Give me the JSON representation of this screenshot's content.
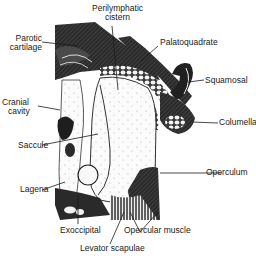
{
  "figure": {
    "labels": {
      "perilymphatic_cistern": [
        "Perilymphatic",
        "cistern"
      ],
      "parotic_cartilage": [
        "Parotic",
        "cartilage"
      ],
      "palatoquadrate": "Palatoquadrate",
      "squamosal": "Squamosal",
      "cranial_cavity": [
        "Cranial",
        "cavity"
      ],
      "columella": "Columella",
      "saccule": "Saccule",
      "operculum": "Operculum",
      "lagena": "Lagena",
      "exoccipital": "Exoccipital",
      "opercular_muscle": "Opercular muscle",
      "levator_scapulae": "Levator scapulae"
    },
    "colors": {
      "ink": "#1a1a1a",
      "dark_tissue": "#262626",
      "background": "#ffffff",
      "cavity_fill": "#f4f4f4"
    }
  }
}
